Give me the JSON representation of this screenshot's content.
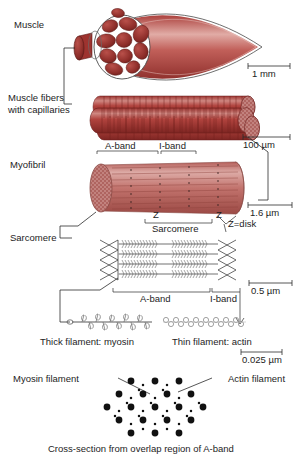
{
  "figure": {
    "caption_bottom": "Cross-section from overlap region of A-band"
  },
  "levels": [
    {
      "key": "muscle",
      "label": "Muscle"
    },
    {
      "key": "fibers",
      "label": "Muscle fibers\nwith capillaries"
    },
    {
      "key": "fibers_line1",
      "label": "Muscle fibers"
    },
    {
      "key": "fibers_line2",
      "label": "with capillaries"
    },
    {
      "key": "myofibril",
      "label": "Myofibril"
    },
    {
      "key": "sarcomere",
      "label": "Sarcomere"
    }
  ],
  "scalebars": [
    {
      "id": "scale-1mm",
      "label": "1 mm"
    },
    {
      "id": "scale-100um",
      "label": "100 µm"
    },
    {
      "id": "scale-1p6um",
      "label": "1.6 µm"
    },
    {
      "id": "scale-0p5um",
      "label": "0.5 µm"
    },
    {
      "id": "scale-0p025um",
      "label": "0.025 µm"
    }
  ],
  "annotations": {
    "myofibril_aband": "A-band",
    "myofibril_iband": "I-band",
    "z_left": "Z",
    "z_right": "Z",
    "z_disk": "Z=disk",
    "sarcomere_bracket": "Sarcomere",
    "sarcomere_aband": "A-band",
    "sarcomere_iband": "I-band",
    "thick_filament": "Thick filament: myosin",
    "thin_filament": "Thin filament: actin",
    "myosin_filament": "Myosin filament",
    "actin_filament": "Actin filament",
    "cross_section": "Cross-section from overlap region of A-band"
  },
  "colors": {
    "muscle_red_dark": "#8c2b28",
    "muscle_red_mid": "#b0443f",
    "muscle_red_light": "#c9706a",
    "muscle_pale": "#e3b5b0",
    "myofibril_fill": "#c58b88",
    "ink": "#1d1d1d",
    "line": "#2b2b2b",
    "filament_gray": "#9a9a9a",
    "background": "#ffffff"
  },
  "cross_section": {
    "myosin_dot_count": 19,
    "actin_dot_count": 24,
    "myosin_dot_color": "#111111",
    "actin_dot_color": "#111111",
    "description": "Hexagonal lattice: large dots = myosin (thick) filaments, small dots = actin (thin) filaments"
  }
}
